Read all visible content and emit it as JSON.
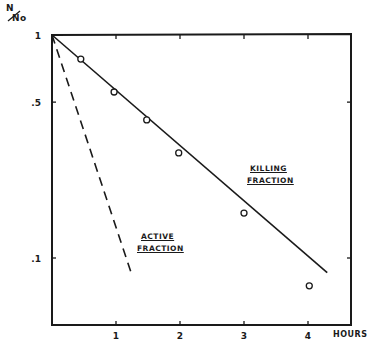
{
  "chart_data": {
    "type": "line",
    "title": "",
    "ylabel": "N/No",
    "xlabel": "HOURS",
    "yscale": "log",
    "ylim": [
      0.05,
      1
    ],
    "xlim": [
      0,
      4.6
    ],
    "x_ticks": [
      1,
      2,
      3,
      4
    ],
    "x_tick_labels": [
      "1",
      "2",
      "3",
      "4"
    ],
    "y_ticks": [
      1,
      0.5,
      0.1
    ],
    "y_tick_labels": [
      "1",
      ".5",
      ".1"
    ],
    "grid": false,
    "legend": null,
    "series": [
      {
        "name": "KILLING FRACTION",
        "style": "solid",
        "fit_line": {
          "x": [
            0,
            4.3
          ],
          "y": [
            1.0,
            0.086
          ]
        },
        "points": {
          "x": [
            0.45,
            0.97,
            1.48,
            1.98,
            3.0,
            4.02
          ],
          "y": [
            0.78,
            0.555,
            0.416,
            0.296,
            0.159,
            0.075
          ]
        },
        "marker": "open-circle"
      },
      {
        "name": "ACTIVE FRACTION",
        "style": "dashed",
        "fit_line": {
          "x": [
            0,
            1.23
          ],
          "y": [
            1.0,
            0.087
          ]
        }
      }
    ],
    "annotations": [
      {
        "text": [
          "KILLING",
          "FRACTION"
        ],
        "x": 3.1,
        "y": 0.3
      },
      {
        "text": [
          "ACTIVE",
          "FRACTION"
        ],
        "x": 1.6,
        "y": 0.12
      }
    ]
  },
  "labels": {
    "ylabel_top": "N",
    "ylabel_bottom": "No",
    "xlabel": "HOURS",
    "ann_killing_1": "KILLING",
    "ann_killing_2": "FRACTION",
    "ann_active_1": "ACTIVE",
    "ann_active_2": "FRACTION"
  }
}
